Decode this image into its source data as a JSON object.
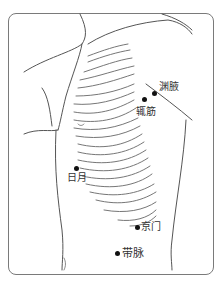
{
  "diagram": {
    "type": "acupuncture-point-chart",
    "region": "lateral torso",
    "points": [
      {
        "id": "yuanye",
        "label": "渊腋",
        "x": 154,
        "y": 93
      },
      {
        "id": "zhejin",
        "label": "辄筋",
        "x": 144,
        "y": 99
      },
      {
        "id": "riyue",
        "label": "日月",
        "x": 76,
        "y": 168
      },
      {
        "id": "jingmen",
        "label": "京门",
        "x": 137,
        "y": 227
      },
      {
        "id": "daimai",
        "label": "带脉",
        "x": 117,
        "y": 253
      }
    ],
    "stroke_color": "#555555",
    "dot_color": "#111111"
  }
}
